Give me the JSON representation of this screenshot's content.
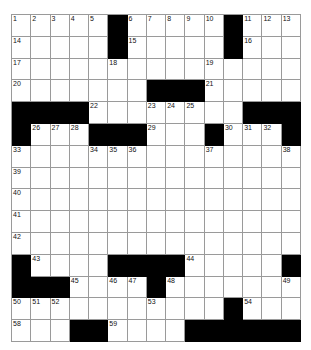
{
  "puzzle": {
    "type": "crossword-grid",
    "rows": 15,
    "columns": 15,
    "cell_colors": {
      "open": "#ffffff",
      "block": "#000000",
      "grid_line": "#9a9a9a",
      "number_text": "#111111"
    },
    "grid": [
      [
        "1",
        "2",
        "3",
        "4",
        "5",
        "#",
        "6",
        "7",
        "8",
        "9",
        "10",
        "#",
        "11",
        "12",
        "13"
      ],
      [
        "14",
        "",
        "",
        "",
        "",
        "#",
        "15",
        "",
        "",
        "",
        "",
        "#",
        "16",
        "",
        ""
      ],
      [
        "17",
        "",
        "",
        "",
        "",
        "18",
        "",
        "",
        "",
        "",
        "19",
        "",
        "",
        "",
        ""
      ],
      [
        "20",
        "",
        "",
        "",
        "",
        "",
        "",
        "#",
        "#",
        "#",
        "21",
        "",
        "",
        "",
        ""
      ],
      [
        "#",
        "#",
        "#",
        "#",
        "22",
        "",
        "",
        "23",
        "24",
        "25",
        "",
        "",
        "#",
        "#",
        "#"
      ],
      [
        "#",
        "26",
        "27",
        "28",
        "#",
        "#",
        "#",
        "29",
        "",
        "",
        "#",
        "30",
        "31",
        "32",
        "#"
      ],
      [
        "33",
        "",
        "",
        "",
        "34",
        "35",
        "36",
        "",
        "",
        "",
        "37",
        "",
        "",
        "",
        "38"
      ],
      [
        "39",
        "",
        "",
        "",
        "",
        "",
        "",
        "",
        "",
        "",
        "",
        "",
        "",
        "",
        ""
      ],
      [
        "40",
        "",
        "",
        "",
        "",
        "",
        "",
        "",
        "",
        "",
        "",
        "",
        "",
        "",
        ""
      ],
      [
        "41",
        "",
        "",
        "",
        "",
        "",
        "",
        "",
        "",
        "",
        "",
        "",
        "",
        "",
        ""
      ],
      [
        "42",
        "",
        "",
        "",
        "",
        "",
        "",
        "",
        "",
        "",
        "",
        "",
        "",
        "",
        ""
      ],
      [
        "#",
        "43",
        "",
        "",
        "",
        "#",
        "#",
        "#",
        "#",
        "44",
        "",
        "",
        "",
        "",
        "#"
      ],
      [
        "#",
        "#",
        "#",
        "45",
        "",
        "46",
        "47",
        "#",
        "48",
        "",
        "",
        "",
        "",
        "",
        "49"
      ],
      [
        "50",
        "51",
        "52",
        "",
        "",
        "",
        "",
        "53",
        "",
        "",
        "",
        "#",
        "54",
        "",
        ""
      ],
      [
        "55",
        "",
        "",
        "#",
        "56",
        "",
        "",
        "",
        "",
        "",
        "",
        "#",
        "57",
        "",
        ""
      ]
    ],
    "grid_row_15_note": "final row",
    "last_row": [
      "58",
      "",
      "",
      "#",
      "#",
      "59",
      "",
      "",
      "",
      "#",
      "#",
      "#",
      "#",
      "#",
      "#"
    ]
  }
}
